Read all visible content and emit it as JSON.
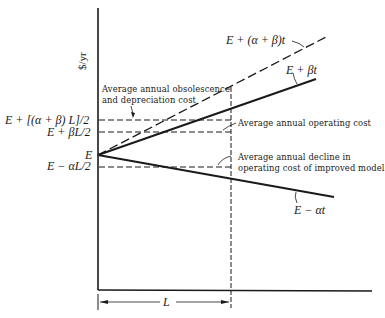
{
  "figure": {
    "y_axis_label": "$/yr",
    "x_span_label": "L",
    "origin_label": "E",
    "y_ticks": {
      "total_avg": "E + [(α + β) L]/2",
      "operating_avg": "E + βL/2",
      "origin": "E",
      "decline_avg": "E − αL/2"
    },
    "curves": [
      {
        "name": "obsolescence-plus-operating",
        "label": "E + (α + β)t",
        "style": "dashed"
      },
      {
        "name": "operating-cost",
        "label": "E + βt",
        "style": "solid"
      },
      {
        "name": "improved-model-cost",
        "label": "E − αt",
        "style": "solid"
      }
    ],
    "annotations": {
      "obsolescence_line1": "Average annual obsolescence",
      "obsolescence_line2": "and depreciation cost",
      "operating": "Average annual operating cost",
      "decline_line1": "Average annual decline in",
      "decline_line2": "operating cost of improved model"
    }
  }
}
